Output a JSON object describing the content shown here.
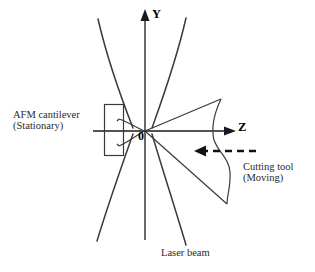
{
  "figure": {
    "name": "afm-cantilever-laser-beam-cutting-tool-schematic",
    "background_color": "#ffffff",
    "stroke_color": "#3a3a3a",
    "axis_color": "#1a1a1a",
    "text_color": "#2a2a2a",
    "width": 315,
    "height": 272
  },
  "axes": {
    "y_label": "Y",
    "z_label": "Z",
    "origin_label": "0",
    "origin_x": 145,
    "origin_y": 131
  },
  "labels": {
    "afm_cantilever": "AFM cantilever\n(Stationary)",
    "afm_cantilever_line1": "AFM cantilever",
    "afm_cantilever_line2": "(Stationary)",
    "cutting_tool": "Cutting tool\n(Moving)",
    "cutting_tool_line1": "Cutting tool",
    "cutting_tool_line2": "(Moving)",
    "laser_beam": "Laser beam"
  },
  "elements": {
    "cantilever_body": "rectangle",
    "cantilever_tip": "wedge-to-origin",
    "laser_beam": "hourglass-focused-beam",
    "cutting_tool": "wedge-with-curved-back",
    "motion_arrow": "dashed-leftward-arrow"
  },
  "motion": {
    "direction": "leftward",
    "style": "dashed"
  }
}
